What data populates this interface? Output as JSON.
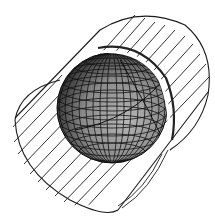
{
  "figure": {
    "colors": {
      "background": "#ffffff",
      "line": "#1a1a1a",
      "sphere_light": "#b8b8b8",
      "sphere_mid": "#7a7a7a",
      "sphere_dark": "#1e1e1e",
      "gap": "#ffffff"
    }
  }
}
